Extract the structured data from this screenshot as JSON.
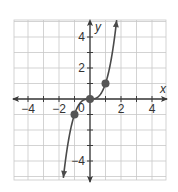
{
  "chart_data": {
    "type": "line",
    "title": "",
    "function": "y = x^3",
    "xlabel": "x",
    "ylabel": "y",
    "xlim": [
      -4.9,
      4.9
    ],
    "ylim": [
      -5.1,
      5.1
    ],
    "grid": true,
    "x_ticks": [
      -4,
      -2,
      0,
      2,
      4
    ],
    "y_ticks": [
      -4,
      2,
      4
    ],
    "x_tick_labels": [
      "−4",
      "−2",
      "2",
      "4"
    ],
    "y_tick_labels": [
      "4",
      "2",
      "−4"
    ],
    "origin_label": "0",
    "series": [
      {
        "name": "y = x^3",
        "x": [
          -1.72,
          -1.5,
          -1.25,
          -1,
          -0.75,
          -0.5,
          -0.25,
          0,
          0.25,
          0.5,
          0.75,
          1,
          1.25,
          1.5,
          1.72
        ],
        "y": [
          -5.09,
          -3.375,
          -1.953,
          -1,
          -0.422,
          -0.125,
          -0.016,
          0,
          0.016,
          0.125,
          0.422,
          1,
          1.953,
          3.375,
          5.09
        ],
        "arrows_both_ends": true
      }
    ],
    "points": [
      {
        "x": -1,
        "y": -1
      },
      {
        "x": 0,
        "y": 0
      },
      {
        "x": 1,
        "y": 1
      }
    ]
  },
  "colors": {
    "grid": "#c8c8c8",
    "axis": "#3a3a3a",
    "curve": "#4a4a4a",
    "point": "#555555"
  }
}
